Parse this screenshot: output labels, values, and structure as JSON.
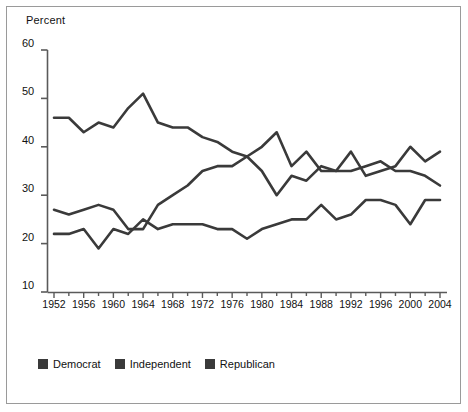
{
  "figure": {
    "border_color": "#9a9a9a",
    "background": "#ffffff"
  },
  "chart_data": {
    "type": "line",
    "title": "",
    "subtitle": "",
    "xlabel": "",
    "ylabel": "Percent",
    "ylim": [
      10,
      60
    ],
    "xlim": [
      1952,
      2004
    ],
    "grid": false,
    "legend_position": "bottom-left",
    "y_ticks": [
      10,
      20,
      30,
      40,
      50,
      60
    ],
    "y_tick_labels": [
      "10",
      "20",
      "30",
      "40",
      "50",
      "60"
    ],
    "x_ticks": [
      1952,
      1954,
      1956,
      1958,
      1960,
      1962,
      1964,
      1966,
      1968,
      1970,
      1972,
      1974,
      1976,
      1978,
      1980,
      1982,
      1984,
      1986,
      1988,
      1990,
      1992,
      1994,
      1996,
      1998,
      2000,
      2002,
      2004
    ],
    "x_tick_labels": [
      "1952",
      "1956",
      "1960",
      "1964",
      "1968",
      "1972",
      "1976",
      "1980",
      "1984",
      "1988",
      "1992",
      "1996",
      "2000",
      "2004"
    ],
    "x_labeled_years": [
      1952,
      1956,
      1960,
      1964,
      1968,
      1972,
      1976,
      1980,
      1984,
      1988,
      1992,
      1996,
      2000,
      2004
    ],
    "x": [
      1952,
      1954,
      1956,
      1958,
      1960,
      1962,
      1964,
      1966,
      1968,
      1970,
      1972,
      1974,
      1976,
      1978,
      1980,
      1982,
      1984,
      1986,
      1988,
      1990,
      1992,
      1994,
      1996,
      1998,
      2000,
      2002,
      2004
    ],
    "series": [
      {
        "name": "Democrat",
        "color": "#3a3a3a",
        "values": [
          46,
          46,
          43,
          45,
          44,
          48,
          51,
          45,
          44,
          44,
          42,
          41,
          39,
          38,
          40,
          43,
          36,
          39,
          35,
          35,
          35,
          36,
          37,
          35,
          35,
          34,
          32
        ]
      },
      {
        "name": "Independent",
        "color": "#3a3a3a",
        "values": [
          27,
          26,
          27,
          28,
          27,
          23,
          23,
          28,
          30,
          32,
          35,
          36,
          36,
          38,
          35,
          30,
          34,
          33,
          36,
          35,
          39,
          34,
          35,
          36,
          40,
          37,
          39
        ]
      },
      {
        "name": "Republican",
        "color": "#3a3a3a",
        "values": [
          22,
          22,
          23,
          19,
          23,
          22,
          25,
          23,
          24,
          24,
          24,
          23,
          23,
          21,
          23,
          24,
          25,
          25,
          28,
          25,
          26,
          29,
          29,
          28,
          24,
          29,
          29
        ]
      }
    ]
  },
  "legend": {
    "items": [
      {
        "label": "Democrat",
        "color": "#3a3a3a"
      },
      {
        "label": "Independent",
        "color": "#3a3a3a"
      },
      {
        "label": "Republican",
        "color": "#3a3a3a"
      }
    ]
  },
  "axis_title": {
    "y": "Percent"
  }
}
